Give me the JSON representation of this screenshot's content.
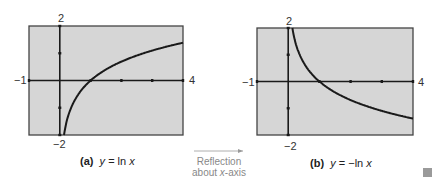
{
  "chart_data": [
    {
      "type": "line",
      "panel": "a",
      "caption_label": "(a)",
      "caption_eq": "y = ln  x",
      "function": "ln(x)",
      "xlim": [
        -1,
        4
      ],
      "ylim": [
        -2,
        2
      ],
      "xtick_labels": {
        "left": "−1",
        "right": "4"
      },
      "ytick_labels": {
        "top": "2",
        "bottom": "−2"
      },
      "ticks_x": [
        1,
        2,
        3
      ],
      "ticks_y": [
        -1,
        1
      ],
      "grid": false,
      "series": [
        {
          "name": "y = ln x",
          "x": [
            0.14,
            0.2,
            0.3,
            0.5,
            0.75,
            1,
            1.5,
            2,
            2.5,
            3,
            3.5,
            4
          ],
          "y": [
            -1.97,
            -1.61,
            -1.2,
            -0.69,
            -0.29,
            0,
            0.41,
            0.69,
            0.92,
            1.1,
            1.25,
            1.39
          ]
        }
      ]
    },
    {
      "type": "line",
      "panel": "b",
      "caption_label": "(b)",
      "caption_eq": "y = −ln  x",
      "function": "-ln(x)",
      "xlim": [
        -1,
        4
      ],
      "ylim": [
        -2,
        2
      ],
      "xtick_labels": {
        "left": "−1",
        "right": "4"
      },
      "ytick_labels": {
        "top": "2",
        "bottom": "−2"
      },
      "ticks_x": [
        1,
        2,
        3
      ],
      "ticks_y": [
        -1,
        1
      ],
      "grid": false,
      "series": [
        {
          "name": "y = −ln x",
          "x": [
            0.14,
            0.2,
            0.3,
            0.5,
            0.75,
            1,
            1.5,
            2,
            2.5,
            3,
            3.5,
            4
          ],
          "y": [
            1.97,
            1.61,
            1.2,
            0.69,
            0.29,
            0,
            -0.41,
            -0.69,
            -0.92,
            -1.1,
            -1.25,
            -1.39
          ]
        }
      ]
    }
  ],
  "figure": {
    "panel_a": {
      "label": "(a)",
      "eq_prefix": "y",
      "eq_mid": " = ln  ",
      "eq_var": "x"
    },
    "panel_b": {
      "label": "(b)",
      "eq_prefix": "y",
      "eq_mid": " = −ln  ",
      "eq_var": "x"
    },
    "transition": {
      "line1": "Reflection",
      "line2_prefix": "about ",
      "line2_var": "x",
      "line2_suffix": "-axis"
    },
    "axis_labels": {
      "ymax": "2",
      "ymin": "−2",
      "xmin": "−1",
      "xmax": "4"
    }
  },
  "colors": {
    "plot_bg": "#d6d6d6",
    "frame": "#444444",
    "curve": "#1a1a1a",
    "arrow": "#999999"
  }
}
